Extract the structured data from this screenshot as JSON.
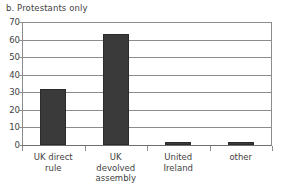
{
  "chart_data": {
    "type": "bar",
    "title": "b. Protestants only",
    "xlabel": "",
    "ylabel": "",
    "categories": [
      "UK direct rule",
      "UK devolved assembly",
      "United Ireland",
      "other"
    ],
    "values": [
      32,
      63,
      2,
      2
    ],
    "ylim": [
      0,
      70
    ],
    "yticks": [
      0,
      10,
      20,
      30,
      40,
      50,
      60,
      70
    ],
    "ytick_labels": [
      "0",
      "10",
      "20",
      "30",
      "40",
      "50",
      "60",
      "70"
    ],
    "grid": true,
    "legend": false,
    "legend_position": "none",
    "bar_color": "#3a3a3a",
    "grid_color": "#8c8c8c",
    "text_color": "#3f3f3f",
    "background_color": "#ffffff"
  },
  "category_label_lines": [
    [
      "UK direct",
      "rule"
    ],
    [
      "UK",
      "devolved",
      "assembly"
    ],
    [
      "United",
      "Ireland"
    ],
    [
      "other"
    ]
  ]
}
